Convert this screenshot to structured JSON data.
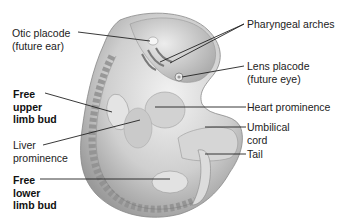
{
  "figure": {
    "labels_left": [
      {
        "id": "otic",
        "lines": [
          "Otic placode",
          "(future ear)"
        ],
        "bold": false
      },
      {
        "id": "upper_limb",
        "lines": [
          "Free",
          "upper",
          "limb bud"
        ],
        "bold": true
      },
      {
        "id": "liver",
        "lines": [
          "Liver",
          "prominence"
        ],
        "bold": false
      },
      {
        "id": "lower_limb",
        "lines": [
          "Free",
          "lower",
          "limb bud"
        ],
        "bold": true
      }
    ],
    "labels_right": [
      {
        "id": "pharyngeal",
        "lines": [
          "Pharyngeal arches"
        ],
        "bold": false
      },
      {
        "id": "lens",
        "lines": [
          "Lens placode",
          "(future eye)"
        ],
        "bold": false
      },
      {
        "id": "heart",
        "lines": [
          "Heart prominence"
        ],
        "bold": false
      },
      {
        "id": "umbilical",
        "lines": [
          "Umbilical",
          "cord"
        ],
        "bold": false
      },
      {
        "id": "tail",
        "lines": [
          "Tail"
        ],
        "bold": false
      }
    ],
    "colors": {
      "skin": "#d9d9d9",
      "skin_shadow": "#a8a8a8",
      "somite": "#8f8f8f",
      "leader_line": "#222222"
    }
  }
}
